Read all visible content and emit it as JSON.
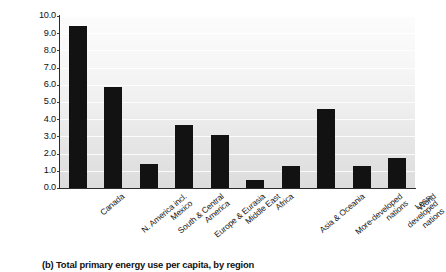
{
  "chart_data": {
    "type": "bar",
    "title": "",
    "caption": "(b) Total primary energy use per capita, by region",
    "xlabel": "",
    "ylabel": "Total primary energy use/person/yr\n(Mtoe) for 2013",
    "ylim": [
      0.0,
      10.0
    ],
    "ytick_labels": [
      "10.0",
      "9.0",
      "8.0",
      "7.0",
      "6.0",
      "5.0",
      "4.0",
      "3.0",
      "2.0",
      "1.0",
      "0.0"
    ],
    "ytick_values": [
      10.0,
      9.0,
      8.0,
      7.0,
      6.0,
      5.0,
      4.0,
      3.0,
      2.0,
      1.0,
      0.0
    ],
    "grid": true,
    "legend": "none",
    "bar_color": "#121212",
    "plot_background": "#e8e8e8",
    "categories": [
      "Canada",
      "N. America incl.\nMexico",
      "South & Central\nAmerica",
      "Europe & Eurasia",
      "Middle East",
      "Africa",
      "Asia & Oceania",
      "More-developed\nnations",
      "Less-developed\nnations",
      "World"
    ],
    "values": [
      9.4,
      5.9,
      1.4,
      3.65,
      3.1,
      0.45,
      1.3,
      4.6,
      1.3,
      1.75
    ]
  }
}
